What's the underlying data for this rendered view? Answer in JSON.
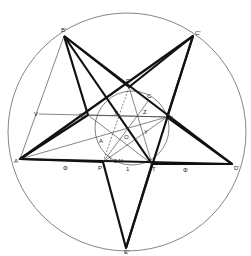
{
  "diagram": {
    "type": "geometry",
    "title": "",
    "outer_circle": {
      "cx": 127,
      "cy": 132,
      "r": 119
    },
    "inner_circle": {
      "cx": 132,
      "cy": 128,
      "r": 37
    },
    "points": {
      "B'": [
        64,
        36
      ],
      "C'": [
        193,
        36
      ],
      "A'": [
        20,
        159
      ],
      "D'": [
        232,
        164
      ],
      "E'": [
        126,
        248
      ],
      "R": [
        129,
        87
      ],
      "S": [
        167,
        117
      ],
      "T": [
        152,
        164
      ],
      "P": [
        103,
        162
      ],
      "Q": [
        88,
        115
      ],
      "C": [
        149,
        100
      ],
      "Z": [
        145,
        116
      ],
      "X": [
        115,
        116
      ],
      "Y": [
        146,
        130
      ],
      "O": [
        131,
        135
      ],
      "A": [
        100,
        141
      ],
      "V": [
        39,
        114
      ]
    },
    "labels": [
      {
        "id": "B'",
        "text": "B'",
        "x": 61,
        "y": 32
      },
      {
        "id": "C'",
        "text": "C'",
        "x": 195,
        "y": 35
      },
      {
        "id": "A'",
        "text": "A'",
        "x": 14,
        "y": 163
      },
      {
        "id": "D'",
        "text": "D'",
        "x": 234,
        "y": 170
      },
      {
        "id": "E'",
        "text": "E'",
        "x": 124,
        "y": 254
      },
      {
        "id": "R",
        "text": "R",
        "x": 126,
        "y": 83
      },
      {
        "id": "S",
        "text": "S",
        "x": 169,
        "y": 120
      },
      {
        "id": "T",
        "text": "T",
        "x": 152,
        "y": 171
      },
      {
        "id": "P",
        "text": "P",
        "x": 98,
        "y": 170
      },
      {
        "id": "Q",
        "text": "Q",
        "x": 79,
        "y": 117
      },
      {
        "id": "C",
        "text": "C",
        "x": 147,
        "y": 98
      },
      {
        "id": "Z",
        "text": "Z",
        "x": 143,
        "y": 114
      },
      {
        "id": "X",
        "text": "X",
        "x": 114,
        "y": 115
      },
      {
        "id": "Y",
        "text": "Y",
        "x": 144,
        "y": 134
      },
      {
        "id": "O",
        "text": "O",
        "x": 124,
        "y": 139
      },
      {
        "id": "A",
        "text": "A",
        "x": 99,
        "y": 143
      },
      {
        "id": "V",
        "text": "V",
        "x": 34,
        "y": 116
      },
      {
        "id": "angle",
        "text": "54°",
        "x": 114,
        "y": 163
      },
      {
        "id": "phi-left",
        "text": "Φ",
        "x": 63,
        "y": 170
      },
      {
        "id": "phi-right",
        "text": "Φ",
        "x": 183,
        "y": 172
      },
      {
        "id": "one",
        "text": "1",
        "x": 126,
        "y": 171
      }
    ]
  }
}
